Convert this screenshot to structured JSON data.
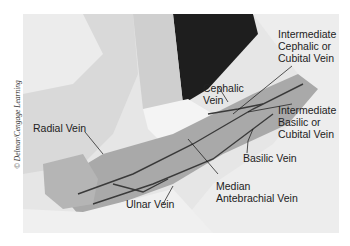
{
  "figure": {
    "credit": "© Delmar/Cengage Learning",
    "labels": {
      "cephalic": "Cephalic\nVein",
      "intermediate_cephalic": "Intermediate\nCephalic or\nCubital Vein",
      "intermediate_basilic": "Intermediate\nBasilic or\nCubital Vein",
      "radial": "Radial Vein",
      "basilic": "Basilic Vein",
      "median_antebrachial": "Median\nAntebrachial Vein",
      "ulnar": "Ulnar Vein"
    }
  }
}
